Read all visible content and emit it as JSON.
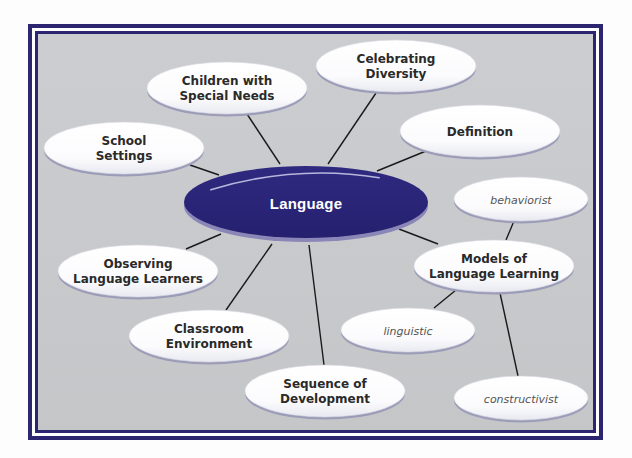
{
  "diagram": {
    "type": "concept-map",
    "colors": {
      "frame": "#2c2670",
      "background": "#c9cacc",
      "center_fill": "#2b2578",
      "center_rim": "#8a86b8",
      "node_fill": "#ffffff",
      "node_rim": "#9b9cb8",
      "connector": "#1a1a1a"
    },
    "center": {
      "label": "Language",
      "cx": 306,
      "cy": 202,
      "rx": 122,
      "ry": 36
    },
    "nodes": [
      {
        "id": "children",
        "lines": [
          "Children with",
          "Special Needs"
        ],
        "cx": 227,
        "cy": 88,
        "rx": 80,
        "ry": 26,
        "kind": "main"
      },
      {
        "id": "diversity",
        "lines": [
          "Celebrating",
          "Diversity"
        ],
        "cx": 396,
        "cy": 66,
        "rx": 80,
        "ry": 26,
        "kind": "main"
      },
      {
        "id": "definition",
        "lines": [
          "Definition"
        ],
        "cx": 480,
        "cy": 131,
        "rx": 80,
        "ry": 26,
        "kind": "main"
      },
      {
        "id": "school",
        "lines": [
          "School",
          "Settings"
        ],
        "cx": 124,
        "cy": 148,
        "rx": 80,
        "ry": 26,
        "kind": "main"
      },
      {
        "id": "observing",
        "lines": [
          "Observing",
          "Language Learners"
        ],
        "cx": 138,
        "cy": 271,
        "rx": 80,
        "ry": 26,
        "kind": "main"
      },
      {
        "id": "classroom",
        "lines": [
          "Classroom",
          "Environment"
        ],
        "cx": 209,
        "cy": 336,
        "rx": 80,
        "ry": 26,
        "kind": "main"
      },
      {
        "id": "sequence",
        "lines": [
          "Sequence of",
          "Development"
        ],
        "cx": 325,
        "cy": 391,
        "rx": 80,
        "ry": 26,
        "kind": "main"
      },
      {
        "id": "models",
        "lines": [
          "Models of",
          "Language Learning"
        ],
        "cx": 494,
        "cy": 266,
        "rx": 80,
        "ry": 26,
        "kind": "main"
      },
      {
        "id": "behaviorist",
        "lines": [
          "behaviorist"
        ],
        "cx": 521,
        "cy": 199,
        "rx": 67,
        "ry": 22,
        "kind": "sub"
      },
      {
        "id": "linguistic",
        "lines": [
          "linguistic"
        ],
        "cx": 408,
        "cy": 330,
        "rx": 67,
        "ry": 22,
        "kind": "sub"
      },
      {
        "id": "constructivist",
        "lines": [
          "constructivist"
        ],
        "cx": 521,
        "cy": 398,
        "rx": 67,
        "ry": 22,
        "kind": "sub"
      }
    ],
    "edges": [
      {
        "from": "center",
        "to": "children",
        "x1": 280,
        "y1": 164,
        "x2": 247,
        "y2": 114
      },
      {
        "from": "center",
        "to": "diversity",
        "x1": 328,
        "y1": 164,
        "x2": 376,
        "y2": 93
      },
      {
        "from": "center",
        "to": "definition",
        "x1": 377,
        "y1": 171,
        "x2": 426,
        "y2": 151
      },
      {
        "from": "center",
        "to": "school",
        "x1": 219,
        "y1": 175,
        "x2": 190,
        "y2": 165
      },
      {
        "from": "center",
        "to": "observing",
        "x1": 221,
        "y1": 234,
        "x2": 186,
        "y2": 249
      },
      {
        "from": "center",
        "to": "classroom",
        "x1": 272,
        "y1": 244,
        "x2": 226,
        "y2": 310
      },
      {
        "from": "center",
        "to": "sequence",
        "x1": 309,
        "y1": 245,
        "x2": 324,
        "y2": 365
      },
      {
        "from": "center",
        "to": "models",
        "x1": 399,
        "y1": 229,
        "x2": 438,
        "y2": 244
      },
      {
        "from": "models",
        "to": "behaviorist",
        "x1": 506,
        "y1": 240,
        "x2": 514,
        "y2": 221
      },
      {
        "from": "models",
        "to": "linguistic",
        "x1": 456,
        "y1": 290,
        "x2": 434,
        "y2": 308
      },
      {
        "from": "models",
        "to": "constructivist",
        "x1": 500,
        "y1": 293,
        "x2": 518,
        "y2": 376
      }
    ]
  }
}
